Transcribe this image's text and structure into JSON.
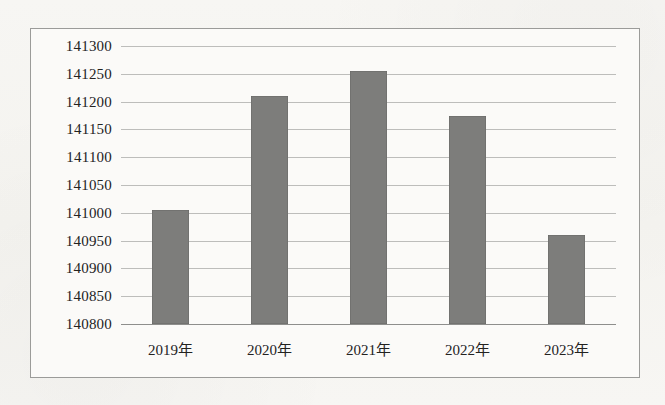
{
  "chart_data": {
    "type": "bar",
    "title": "",
    "subtitle": "",
    "xlabel": "",
    "ylabel": "",
    "categories": [
      "2019年",
      "2020年",
      "2021年",
      "2022年",
      "2023年"
    ],
    "values": [
      141005,
      141210,
      141255,
      141175,
      140960
    ],
    "ylim": [
      140800,
      141300
    ],
    "ytick_step": 50,
    "ytick_labels": [
      "141300",
      "141250",
      "141200",
      "141150",
      "141100",
      "141050",
      "141000",
      "140950",
      "140900",
      "140850",
      "140800"
    ],
    "ytick_values": [
      141300,
      141250,
      141200,
      141150,
      141100,
      141050,
      141000,
      140950,
      140900,
      140850,
      140800
    ],
    "grid": true,
    "legend": false,
    "legend_position": "none",
    "series": [
      {
        "name": "",
        "values": [
          141005,
          141210,
          141255,
          141175,
          140960
        ]
      }
    ]
  },
  "style": {
    "bar_color": "#7d7d7b",
    "grid_color": "#bdbdbb",
    "axis_color": "#8e8e8c",
    "frame_color": "#9b9b99",
    "plot_background": "#fbfaf8",
    "page_background": "#f6f5f2",
    "text_color": "#23221f"
  }
}
